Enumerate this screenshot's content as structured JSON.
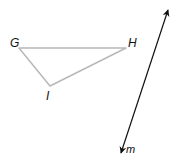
{
  "diagram": {
    "triangle": {
      "vertices": {
        "G": {
          "label": "G",
          "x": 19,
          "y": 48
        },
        "H": {
          "label": "H",
          "x": 126,
          "y": 48
        },
        "I": {
          "label": "I",
          "x": 50,
          "y": 86
        }
      },
      "stroke_color": "#b8b8b8"
    },
    "line_m": {
      "label": "m",
      "start": {
        "x": 168,
        "y": 10
      },
      "end": {
        "x": 121,
        "y": 153
      },
      "arrows": "both",
      "stroke_color": "#111111"
    },
    "labels": {
      "G": "G",
      "H": "H",
      "I": "I",
      "m": "m"
    }
  }
}
